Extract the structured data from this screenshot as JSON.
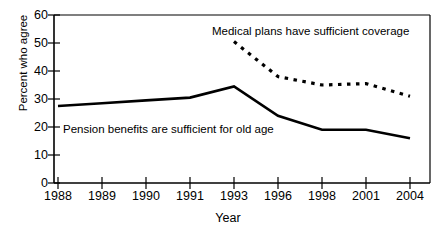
{
  "chart_data": {
    "type": "line",
    "title": "",
    "xlabel": "Year",
    "ylabel": "Percent who agree",
    "categories": [
      "1988",
      "1989",
      "1990",
      "1991",
      "1993",
      "1996",
      "1998",
      "2001",
      "2004"
    ],
    "ylim": [
      0,
      60
    ],
    "yticks": [
      0,
      10,
      20,
      30,
      40,
      50,
      60
    ],
    "grid": false,
    "legend_position": "inline-annotations",
    "series": [
      {
        "name": "Pension benefits are sufficient for old age",
        "style": "solid",
        "color": "#000000",
        "values": [
          27.5,
          28.5,
          29.5,
          30.5,
          34.5,
          24.0,
          19.0,
          19.0,
          16.0
        ]
      },
      {
        "name": "Medical plans have sufficient coverage",
        "style": "dotted",
        "color": "#000000",
        "values": [
          null,
          null,
          null,
          null,
          50.5,
          38.0,
          35.0,
          35.5,
          31.0
        ]
      }
    ],
    "annotations": [
      {
        "id": "medical",
        "text": "Medical plans have sufficient coverage"
      },
      {
        "id": "pension",
        "text": "Pension benefits are sufficient for old age"
      }
    ]
  },
  "axis": {
    "y_tick_labels": [
      "60",
      "50",
      "40",
      "30",
      "20",
      "10",
      "0"
    ],
    "x_tick_labels": [
      "1988",
      "1989",
      "1990",
      "1991",
      "1993",
      "1996",
      "1998",
      "2001",
      "2004"
    ],
    "y_title": "Percent who agree",
    "x_title": "Year"
  },
  "colors": {
    "ink": "#000000",
    "background": "#ffffff"
  }
}
